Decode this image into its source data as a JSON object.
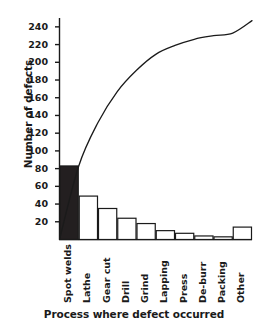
{
  "chart_data": {
    "type": "bar",
    "title": "",
    "subtitle": "",
    "xlabel": "Process where defect occurred",
    "ylabel": "Number of defects",
    "categories": [
      "Spot welds",
      "Lathe",
      "Gear cut",
      "Drill",
      "Grind",
      "Lapping",
      "Press",
      "De-burr",
      "Packing",
      "Other"
    ],
    "values": [
      83,
      49,
      35,
      24,
      18,
      10,
      7,
      4,
      3,
      14
    ],
    "series": [
      {
        "name": "Number of defects",
        "type": "bar",
        "values": [
          83,
          49,
          35,
          24,
          18,
          10,
          7,
          4,
          3,
          14
        ]
      },
      {
        "name": "Cumulative defects",
        "type": "line",
        "values": [
          83,
          132,
          167,
          191,
          209,
          219,
          226,
          230,
          233,
          247
        ]
      }
    ],
    "cumulative": [
      83,
      132,
      167,
      191,
      209,
      219,
      226,
      230,
      233,
      247
    ],
    "ylim": [
      0,
      250
    ],
    "yticks": [
      20,
      40,
      60,
      80,
      100,
      120,
      140,
      160,
      180,
      200,
      220,
      240
    ],
    "ytick_labels": [
      "20",
      "40",
      "60",
      "80",
      "100",
      "120",
      "140",
      "160",
      "180",
      "200",
      "220",
      "240"
    ],
    "grid": false,
    "legend": "none",
    "highlight_category": "Spot welds",
    "colors": {
      "axis": "#1a1a1a",
      "bar_fill": "#ffffff",
      "bar_stroke": "#1a1a1a",
      "highlight_fill": "#231f20",
      "curve": "#1a1a1a",
      "text": "#1a1a1a",
      "background": "#ffffff"
    }
  },
  "axes": {
    "y_title": "Number of defects",
    "x_title": "Process where defect occurred"
  }
}
